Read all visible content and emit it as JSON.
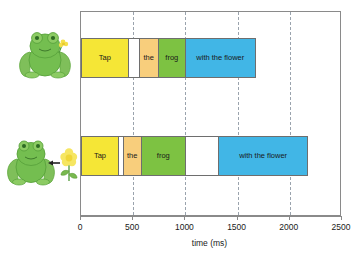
{
  "chart_data": {
    "type": "bar",
    "title": "",
    "xlabel": "time (ms)",
    "ylabel": "",
    "xlim": [
      0,
      2500
    ],
    "grid": true,
    "orientation": "horizontal",
    "legend_position": "none",
    "xticks": [
      0,
      500,
      1000,
      1500,
      2000,
      2500
    ],
    "xticklabels": [
      "0",
      "500",
      "1000",
      "1500",
      "2000",
      "2500"
    ],
    "gridlines": [
      500,
      1000,
      1500,
      2000
    ],
    "colors": {
      "tap": "#F5E636",
      "the": "#F8CE7C",
      "frog": "#7DC242",
      "with_the_flower": "#41B6E6",
      "gap": "#FFFFFF",
      "outline": "#6E6E6E",
      "axis": "#8A8A8A",
      "grid": "#9AA3AD"
    },
    "series": [
      {
        "name": "frog-holding-flower",
        "icon": "frog-holding-flower-icon",
        "segments": [
          {
            "label": "Tap",
            "start": 0,
            "end": 450,
            "color": "#F5E636",
            "kind": "word"
          },
          {
            "label": "",
            "start": 450,
            "end": 555,
            "color": "#FFFFFF",
            "kind": "gap"
          },
          {
            "label": "the",
            "start": 555,
            "end": 740,
            "color": "#F8CE7C",
            "kind": "word"
          },
          {
            "label": "frog",
            "start": 740,
            "end": 1000,
            "color": "#7DC242",
            "kind": "word"
          },
          {
            "label": "with the flower",
            "start": 1000,
            "end": 1675,
            "color": "#41B6E6",
            "kind": "word"
          }
        ]
      },
      {
        "name": "frog-and-separate-flower",
        "icon": "frog-with-arrow-to-flower-icon",
        "segments": [
          {
            "label": "Tap",
            "start": 0,
            "end": 355,
            "color": "#F5E636",
            "kind": "word"
          },
          {
            "label": "",
            "start": 355,
            "end": 400,
            "color": "#FFFFFF",
            "kind": "gap"
          },
          {
            "label": "the",
            "start": 400,
            "end": 575,
            "color": "#F8CE7C",
            "kind": "word"
          },
          {
            "label": "frog",
            "start": 575,
            "end": 1000,
            "color": "#7DC242",
            "kind": "word"
          },
          {
            "label": "",
            "start": 1000,
            "end": 1320,
            "color": "#FFFFFF",
            "kind": "gap"
          },
          {
            "label": "with the flower",
            "start": 1320,
            "end": 2175,
            "color": "#41B6E6",
            "kind": "word"
          }
        ]
      }
    ]
  },
  "illustrations": {
    "top": {
      "name": "frog-holding-flower-icon",
      "description": "green frog holding a small yellow flower"
    },
    "bottom": {
      "name": "frog-with-arrow-to-flower-icon",
      "description": "green frog with arrow pointing from a yellow flower toward the frog"
    }
  }
}
